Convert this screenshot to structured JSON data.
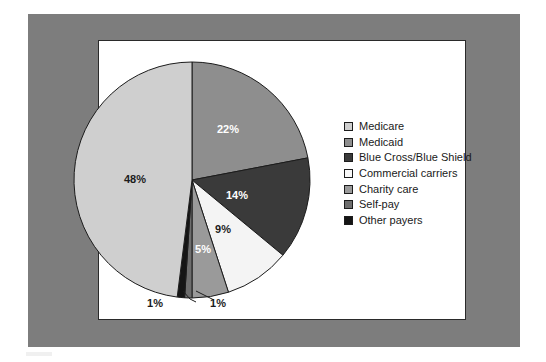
{
  "figure": {
    "frame_color": "#7d7d7d",
    "panel_color": "#ffffff",
    "panel_border_color": "#2a2a2a"
  },
  "chart_data": {
    "type": "pie",
    "title": "",
    "xlabel": "",
    "ylabel": "",
    "legend_position": "right",
    "grid": false,
    "start_angle_deg": 90,
    "direction": "clockwise",
    "categories": [
      "Medicare",
      "Medicaid",
      "Blue Cross/Blue Shield",
      "Commercial carriers",
      "Charity care",
      "Self-pay",
      "Other payers"
    ],
    "values": [
      48,
      22,
      14,
      9,
      5,
      1,
      1
    ],
    "labels": [
      "48%",
      "22%",
      "14%",
      "9%",
      "5%",
      "1%",
      "1%"
    ],
    "colors": [
      "#cfcfcf",
      "#8e8e8e",
      "#3a3a3a",
      "#f4f4f4",
      "#9a9a9a",
      "#6e6e6e",
      "#151515"
    ],
    "slices": [
      {
        "name": "Medicare",
        "value": 48,
        "label": "48%",
        "color": "#cfcfcf",
        "label_color": "dark",
        "label_x": 135,
        "label_y": 183,
        "callout": false
      },
      {
        "name": "Medicaid",
        "value": 22,
        "label": "22%",
        "color": "#8e8e8e",
        "label_color": "light",
        "label_x": 228,
        "label_y": 133,
        "callout": false
      },
      {
        "name": "Blue Cross/Blue Shield",
        "value": 14,
        "label": "14%",
        "color": "#3a3a3a",
        "label_color": "light",
        "label_x": 237,
        "label_y": 199,
        "callout": false
      },
      {
        "name": "Commercial carriers",
        "value": 9,
        "label": "9%",
        "color": "#f4f4f4",
        "label_color": "dark",
        "label_x": 223,
        "label_y": 233,
        "callout": false
      },
      {
        "name": "Charity care",
        "value": 5,
        "label": "5%",
        "color": "#9a9a9a",
        "label_color": "light",
        "label_x": 203,
        "label_y": 253,
        "callout": false
      },
      {
        "name": "Self-pay",
        "value": 1,
        "label": "1%",
        "color": "#6e6e6e",
        "label_color": "dark",
        "label_x": 218,
        "label_y": 307,
        "callout": true
      },
      {
        "name": "Other payers",
        "value": 1,
        "label": "1%",
        "color": "#151515",
        "label_color": "dark",
        "label_x": 155,
        "label_y": 307,
        "callout": true
      }
    ]
  },
  "legend": {
    "items": [
      {
        "label": "Medicare",
        "color": "#cfcfcf"
      },
      {
        "label": "Medicaid",
        "color": "#8e8e8e"
      },
      {
        "label": "Blue Cross/Blue Shield",
        "color": "#3a3a3a"
      },
      {
        "label": "Commercial carriers",
        "color": "#f8f8f8"
      },
      {
        "label": "Charity care",
        "color": "#9a9a9a"
      },
      {
        "label": "Self-pay",
        "color": "#6e6e6e"
      },
      {
        "label": "Other payers",
        "color": "#151515"
      }
    ]
  }
}
